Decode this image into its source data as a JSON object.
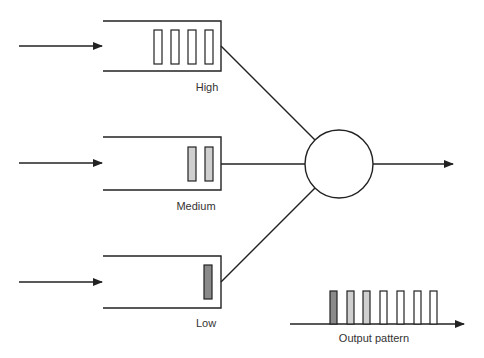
{
  "diagram": {
    "type": "priority-queue-scheduler",
    "colors": {
      "line": "#222222",
      "high_packet": "#ffffff",
      "medium_packet": "#cfcfcf",
      "low_packet": "#8a8a8a"
    },
    "queues": [
      {
        "label": "High",
        "packet_count": 4,
        "packet_fill": "#ffffff"
      },
      {
        "label": "Medium",
        "packet_count": 2,
        "packet_fill": "#cfcfcf"
      },
      {
        "label": "Low",
        "packet_count": 1,
        "packet_fill": "#8a8a8a"
      }
    ],
    "scheduler": {
      "shape": "circle"
    },
    "output": {
      "label": "Output pattern",
      "packets": [
        "#8a8a8a",
        "#cfcfcf",
        "#cfcfcf",
        "#ffffff",
        "#ffffff",
        "#ffffff",
        "#ffffff"
      ]
    }
  }
}
